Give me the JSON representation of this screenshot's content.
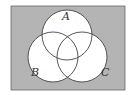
{
  "diagram": {
    "type": "venn",
    "sets": [
      {
        "label": "A",
        "cx": 67,
        "cy": 35,
        "r": 25
      },
      {
        "label": "B",
        "cx": 53,
        "cy": 57,
        "r": 25
      },
      {
        "label": "C",
        "cx": 82,
        "cy": 57,
        "r": 25
      }
    ],
    "colors": {
      "background": "#b4b4b4",
      "circle_fill": "#ffffff",
      "stroke": "#444444"
    }
  }
}
